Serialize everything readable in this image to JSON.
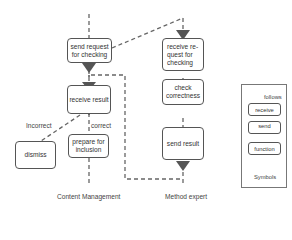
{
  "diagram": {
    "lanes": [
      {
        "id": "content-management",
        "label": "Content Management"
      },
      {
        "id": "method-expert",
        "label": "Method expert"
      }
    ],
    "nodes": {
      "send_request": "send request for checking",
      "receive_result": "receive result",
      "dismiss": "dismiss",
      "prepare": "prepare for inclusion",
      "receive_request": "receive re-quest for checking",
      "check": "check correctness",
      "send_result": "send result"
    },
    "edges": {
      "incorrect": "Incorrect",
      "correct": "correct"
    },
    "legend": {
      "title": "Symbols",
      "follows": "follows",
      "receive": "receive",
      "send": "send",
      "function": "function"
    },
    "colors": {
      "stroke": "#555555",
      "dashed": "#666666",
      "triangle": "#555555"
    }
  }
}
